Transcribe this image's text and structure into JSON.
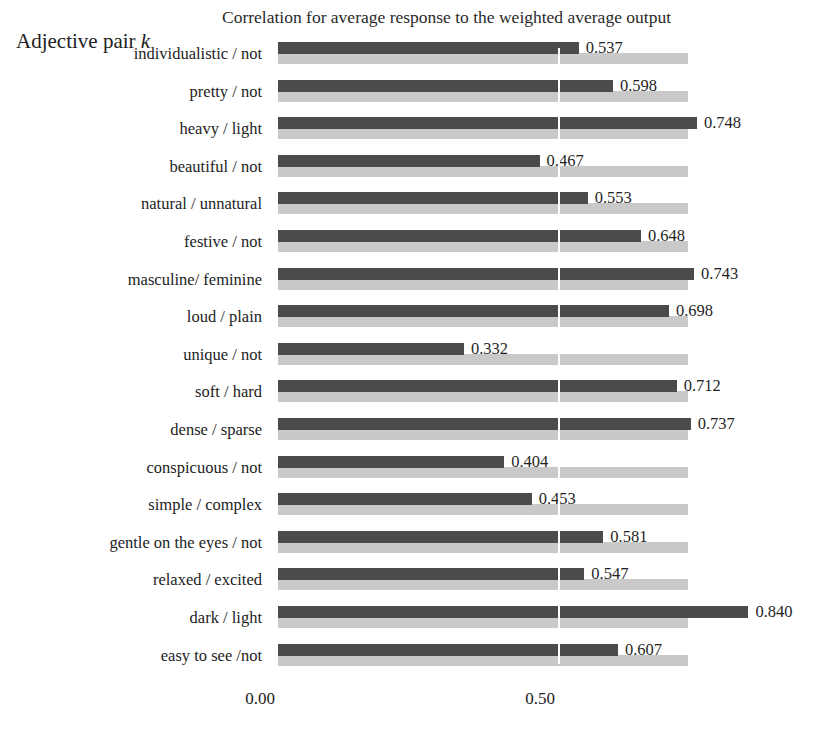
{
  "chart_data": {
    "type": "bar",
    "orientation": "horizontal",
    "title": "Correlation for average response to the weighted average output",
    "ylabel": "Adjective pair k",
    "xlabel": "",
    "xlim": [
      0.0,
      0.9
    ],
    "xticks": [
      0.0,
      0.5
    ],
    "xtick_labels": [
      "0.00",
      "0.50"
    ],
    "grid": "vertical-at-0.50",
    "legend": "none",
    "track_value": 0.732,
    "categories": [
      "individualistic / not",
      "pretty / not",
      "heavy / light",
      "beautiful / not",
      "natural / unnatural",
      "festive / not",
      "masculine/ feminine",
      "loud / plain",
      "unique / not",
      "soft / hard",
      "dense / sparse",
      "conspicuous / not",
      "simple / complex",
      "gentle on the eyes / not",
      "relaxed / excited",
      "dark / light",
      "easy to see /not"
    ],
    "values": [
      0.537,
      0.598,
      0.748,
      0.467,
      0.553,
      0.648,
      0.743,
      0.698,
      0.332,
      0.712,
      0.737,
      0.404,
      0.453,
      0.581,
      0.547,
      0.84,
      0.607
    ],
    "value_labels": [
      "0.537",
      "0.598",
      "0.748",
      "0.467",
      "0.553",
      "0.648",
      "0.743",
      "0.698",
      "0.332",
      "0.712",
      "0.737",
      "0.404",
      "0.453",
      "0.581",
      "0.547",
      "0.840",
      "0.607"
    ],
    "colors": {
      "bar": "#4b4b4b",
      "track": "#c9c9c9",
      "background": "#ffffff",
      "text": "#1f1f1f",
      "gridline": "#ffffff"
    }
  }
}
